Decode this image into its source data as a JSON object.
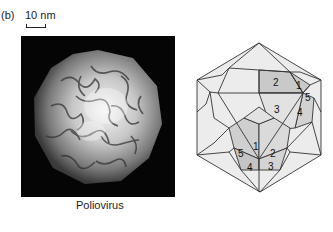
{
  "figure": {
    "panel_label": "(b)",
    "scale_bar": {
      "label": "10 nm"
    },
    "micrograph": {
      "caption": "Poliovirus",
      "background": "#050505"
    },
    "icosahedron": {
      "face_labels_upper_right": [
        "2",
        "1",
        "5",
        "3",
        "4"
      ],
      "face_labels_bottom": [
        "1",
        "5",
        "2",
        "4",
        "3"
      ],
      "colors": {
        "light": "#ececec",
        "mid": "#dcdcdc",
        "dark": "#c4c4c4",
        "stroke": "#333333"
      }
    }
  }
}
